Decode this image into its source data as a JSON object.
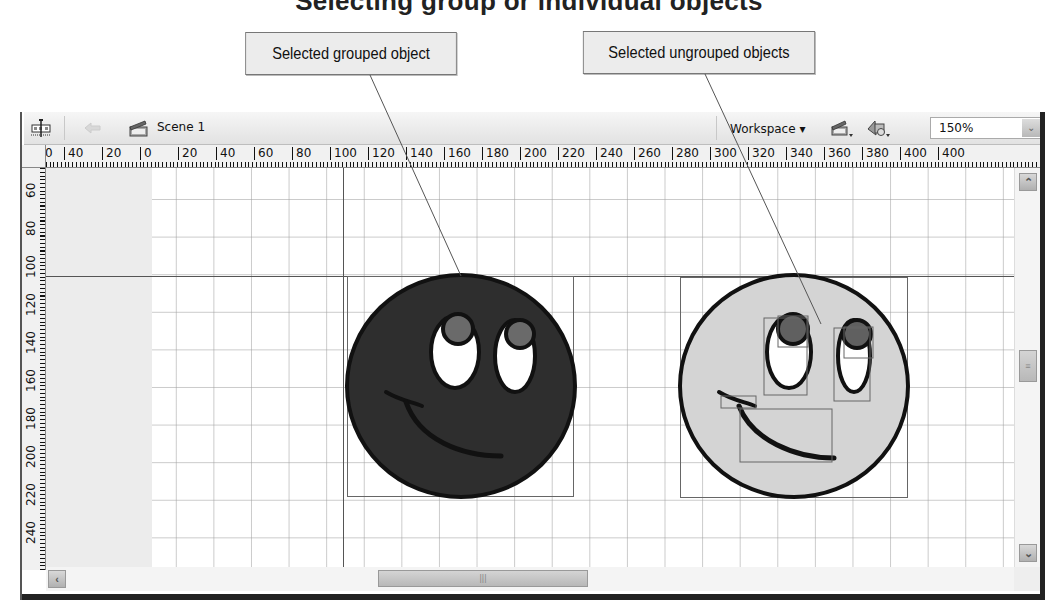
{
  "page_title": "Selecting group or individual objects",
  "callouts": [
    {
      "label": "Selected grouped object"
    },
    {
      "label": "Selected ungrouped objects"
    }
  ],
  "toolbar": {
    "edit_scene_icon": "timeline-icon",
    "back_icon": "back-arrow-icon",
    "scene_icon": "clapperboard-icon",
    "scene_label": "Scene 1",
    "workspace_label": "Workspace ▾",
    "edit_scene_menu_icon": "clapperboard-dropdown-icon",
    "edit_symbol_menu_icon": "symbol-shapes-dropdown-icon",
    "zoom_value": "150%",
    "zoom_arrow": "⌄"
  },
  "rulers": {
    "horizontal": [
      "0",
      "40",
      "20",
      "0",
      "20",
      "40",
      "60",
      "80",
      "100",
      "120",
      "140",
      "160",
      "180",
      "200",
      "220",
      "240",
      "260",
      "280",
      "300",
      "320",
      "340",
      "360",
      "380",
      "400"
    ],
    "vertical": [
      "60",
      "80",
      "100",
      "120",
      "140",
      "160",
      "180",
      "200",
      "220",
      "240"
    ]
  },
  "stage": {
    "objects": [
      {
        "name": "grouped-smiley",
        "fill": "#2e2e2e",
        "state": "selected-grouped"
      },
      {
        "name": "ungrouped-smiley",
        "fill": "#d4d4d4",
        "state": "selected-ungrouped"
      }
    ],
    "pupil_color": "#6a6a6a",
    "eye_white": "#ffffff",
    "outline": "#111111"
  },
  "scrollbars": {
    "up": "⌃",
    "down": "⌄",
    "left": "‹",
    "right": "›",
    "grip": "|||"
  }
}
